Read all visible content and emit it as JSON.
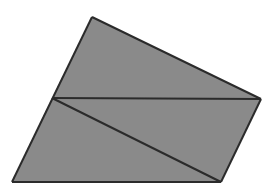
{
  "figure": {
    "shape_type": "quadrilateral",
    "background_color": "#ffffff",
    "fill_color": "#8a8a8a",
    "stroke_color": "#2b2b2b",
    "stroke_width": 2,
    "canvas": {
      "width": 276,
      "height": 193
    },
    "vertices": [
      {
        "name": "apex-top",
        "x": 92,
        "y": 17
      },
      {
        "name": "vertex-right",
        "x": 261,
        "y": 99
      },
      {
        "name": "vertex-bottom-right",
        "x": 221,
        "y": 182
      },
      {
        "name": "vertex-bottom-left",
        "x": 12,
        "y": 182
      }
    ],
    "interior_point": {
      "name": "junction-left-edge",
      "x": 52,
      "y": 98
    },
    "outline_path": "M 92 17 L 261 99 L 221 182 L 12 182 Z",
    "regions": [
      {
        "name": "upper-triangle",
        "path": "M 92 17 L 261 99 L 52 98 Z",
        "fill": "#8a8a8a"
      },
      {
        "name": "middle-triangle",
        "path": "M 52 98 L 261 99 L 221 182 Z",
        "fill": "#8a8a8a"
      },
      {
        "name": "lower-triangle",
        "path": "M 52 98 L 221 182 L 12 182 Z",
        "fill": "#8a8a8a"
      }
    ],
    "edges": [
      {
        "name": "edge-top",
        "path": "M 92 17 L 261 99"
      },
      {
        "name": "edge-right",
        "path": "M 261 99 L 221 182"
      },
      {
        "name": "edge-bottom",
        "path": "M 221 182 L 12 182"
      },
      {
        "name": "edge-left",
        "path": "M 12 182 L 92 17"
      }
    ],
    "internal_lines": [
      {
        "name": "internal-horizontal-chord",
        "path": "M 52 98 L 261 99"
      },
      {
        "name": "internal-diagonal-chord",
        "path": "M 52 98 L 221 182"
      }
    ]
  }
}
